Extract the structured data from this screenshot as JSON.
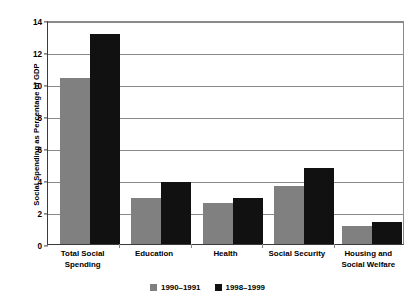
{
  "chart_data": {
    "type": "bar",
    "title": "",
    "xlabel": "",
    "ylabel": "Social Spending as Percentage of GDP",
    "ylim": [
      0,
      14
    ],
    "ytick_step": 2,
    "yticks": [
      "14",
      "12",
      "10",
      "8",
      "6",
      "4",
      "2",
      "0"
    ],
    "grid": true,
    "legend_position": "bottom-center",
    "categories": [
      "Total Social Spending",
      "Education",
      "Health",
      "Social Security",
      "Housing and Social Welfare"
    ],
    "category_lines": [
      [
        "Total Social Spending"
      ],
      [
        "Education"
      ],
      [
        "Health"
      ],
      [
        "Social Security"
      ],
      [
        "Housing and",
        "Social Welfare"
      ]
    ],
    "series": [
      {
        "name": "1990–1991",
        "color": "#808080",
        "values": [
          10.4,
          2.85,
          2.55,
          3.6,
          1.15
        ]
      },
      {
        "name": "1998–1999",
        "color": "#111111",
        "values": [
          13.1,
          3.85,
          2.85,
          4.75,
          1.4
        ]
      }
    ]
  },
  "axis": {
    "y_title": "Social Spending as Percentage of GDP"
  },
  "legend": {
    "items": [
      {
        "label": "1990–1991",
        "color": "#808080"
      },
      {
        "label": "1998–1999",
        "color": "#111111"
      }
    ]
  },
  "colors": {
    "series_1990": "#808080",
    "series_1998": "#111111",
    "gridline": "#8a8a8a",
    "axis": "#3b3b3b",
    "background": "#ffffff"
  }
}
